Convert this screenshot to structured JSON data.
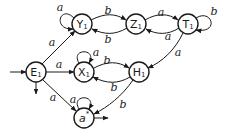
{
  "diagram": {
    "type": "finite-automaton",
    "nodes": [
      {
        "id": "E1",
        "base": "E",
        "sub": "1",
        "start": true,
        "final": true
      },
      {
        "id": "Y1",
        "base": "Y",
        "sub": "1"
      },
      {
        "id": "Z1",
        "base": "Z",
        "sub": "1"
      },
      {
        "id": "T1",
        "base": "T",
        "sub": "1"
      },
      {
        "id": "X1",
        "base": "X",
        "sub": "1"
      },
      {
        "id": "H1",
        "base": "H",
        "sub": "1"
      },
      {
        "id": "astar",
        "base": "a",
        "sup": "*",
        "final": true
      }
    ],
    "edges": [
      {
        "from": "E1",
        "to": "Y1",
        "label": "a"
      },
      {
        "from": "E1",
        "to": "X1",
        "label": "a"
      },
      {
        "from": "E1",
        "to": "astar",
        "label": "a"
      },
      {
        "from": "Y1",
        "to": "Y1",
        "label": "a"
      },
      {
        "from": "Y1",
        "to": "Z1",
        "label": "b"
      },
      {
        "from": "Z1",
        "to": "Y1",
        "label": "b"
      },
      {
        "from": "Z1",
        "to": "T1",
        "label": "a"
      },
      {
        "from": "T1",
        "to": "Z1",
        "label": "a"
      },
      {
        "from": "T1",
        "to": "T1",
        "label": "b"
      },
      {
        "from": "T1",
        "to": "H1",
        "label": "a"
      },
      {
        "from": "X1",
        "to": "X1",
        "label": "a"
      },
      {
        "from": "X1",
        "to": "H1",
        "label": "b"
      },
      {
        "from": "H1",
        "to": "X1",
        "label": "b"
      },
      {
        "from": "H1",
        "to": "astar",
        "label": "b"
      },
      {
        "from": "astar",
        "to": "astar",
        "label": "a"
      }
    ]
  }
}
